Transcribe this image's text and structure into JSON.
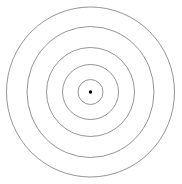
{
  "figure": {
    "name": "concentric-circles-bullseye",
    "background_color": "#ffffff",
    "width": 182,
    "height": 184
  },
  "chart_data": {
    "type": "scatter",
    "title": "",
    "subtitle": "",
    "xlabel": "",
    "ylabel": "",
    "grid": false,
    "legend": null,
    "axes_visible": false,
    "tick_labels": [],
    "annotations": [],
    "center": {
      "x": 90.5,
      "y": 92.0
    },
    "shape": "ellipse",
    "series": [
      {
        "name": "ring-1-outer",
        "rx": 84.0,
        "ry": 85.0,
        "stroke": "#7a7a7a",
        "stroke_width": 0.8,
        "fill": "none"
      },
      {
        "name": "ring-2",
        "rx": 63.5,
        "ry": 65.5,
        "stroke": "#7a7a7a",
        "stroke_width": 0.8,
        "fill": "none"
      },
      {
        "name": "ring-3",
        "rx": 44.0,
        "ry": 44.5,
        "stroke": "#7a7a7a",
        "stroke_width": 0.8,
        "fill": "none"
      },
      {
        "name": "ring-4",
        "rx": 28.0,
        "ry": 27.5,
        "stroke": "#7a7a7a",
        "stroke_width": 0.8,
        "fill": "none"
      },
      {
        "name": "ring-5-inner",
        "rx": 12.5,
        "ry": 12.5,
        "stroke": "#7a7a7a",
        "stroke_width": 0.8,
        "fill": "none"
      }
    ],
    "center_marker": {
      "name": "center-dot",
      "r": 1.7,
      "color": "#000000"
    },
    "ring_count": 5
  }
}
